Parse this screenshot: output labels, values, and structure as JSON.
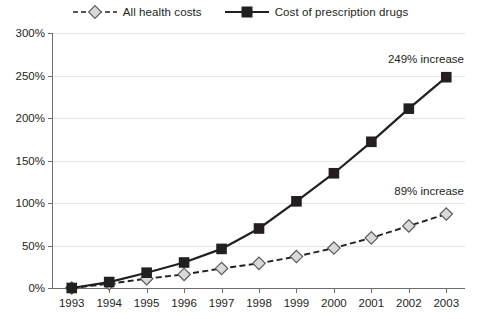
{
  "legend": {
    "entries": [
      {
        "label": "All health costs",
        "marker": "diamond-marker",
        "style": "dashed",
        "color": "#d9d9d9",
        "stroke": "#231f20"
      },
      {
        "label": "Cost of prescription drugs",
        "marker": "square-marker",
        "style": "solid",
        "color": "#231f20",
        "stroke": "#231f20"
      }
    ]
  },
  "annotations": [
    {
      "name": "annotation-prescription",
      "text": "249% increase"
    },
    {
      "name": "annotation-health",
      "text": "89% increase"
    }
  ],
  "chart_data": {
    "type": "line",
    "title": "",
    "xlabel": "",
    "ylabel": "",
    "categories": [
      "1993",
      "1994",
      "1995",
      "1996",
      "1997",
      "1998",
      "1999",
      "2000",
      "2001",
      "2002",
      "2003"
    ],
    "x": [
      1993,
      1994,
      1995,
      1996,
      1997,
      1998,
      1999,
      2000,
      2001,
      2002,
      2003
    ],
    "ylim": [
      0,
      300
    ],
    "ytick_values": [
      0,
      50,
      100,
      150,
      200,
      250,
      300
    ],
    "ytick_labels": [
      "0%",
      "50%",
      "100%",
      "150%",
      "200%",
      "250%",
      "300%"
    ],
    "grid": true,
    "legend_position": "top-center",
    "value_suffix": "%",
    "series": [
      {
        "name": "All health costs",
        "marker": "diamond",
        "line_style": "dashed",
        "values": [
          0,
          5,
          11,
          16,
          23,
          29,
          37,
          47,
          59,
          73,
          87
        ]
      },
      {
        "name": "Cost of prescription drugs",
        "marker": "square",
        "line_style": "solid",
        "values": [
          0,
          7,
          18,
          30,
          46,
          70,
          102,
          135,
          172,
          211,
          248
        ]
      }
    ]
  }
}
